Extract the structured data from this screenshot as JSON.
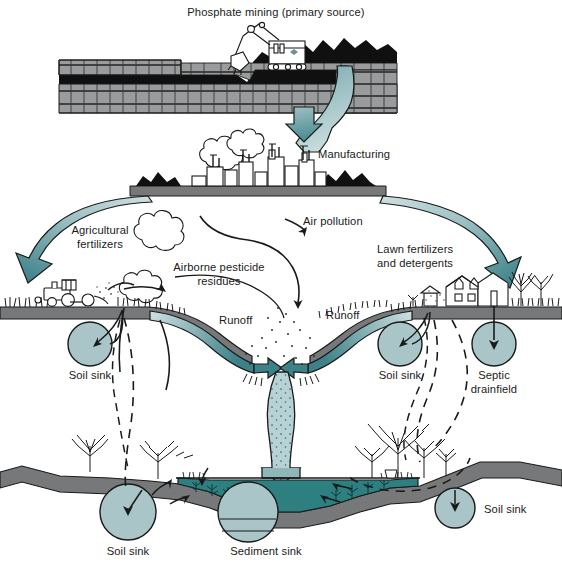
{
  "figure": {
    "title": "Phosphate mining (primary source)",
    "type": "phosphorus-cycle-pollution-pathways-diagram"
  },
  "labels": {
    "phosphate_mining": "Phosphate mining (primary source)",
    "manufacturing": "Manufacturing",
    "air_pollution": "Air pollution",
    "agricultural_fertilizers_line1": "Agricultural",
    "agricultural_fertilizers_line2": "fertilizers",
    "lawn_fertilizers_line1": "Lawn fertilizers",
    "lawn_fertilizers_line2": "and detergents",
    "airborne_pesticide_line1": "Airborne pesticide",
    "airborne_pesticide_line2": "residues",
    "runoff_left": "Runoff",
    "runoff_right": "Runoff",
    "soil_sink_upper_left": "Soil sink",
    "soil_sink_upper_right": "Soil sink",
    "septic_drainfield_line1": "Septic",
    "septic_drainfield_line2": "drainfield",
    "soil_sink_lower_left": "Soil sink",
    "soil_sink_lower_right": "Soil sink",
    "sediment_sink": "Sediment sink"
  },
  "colors": {
    "arrow_light": "#b9d2d4",
    "arrow_dark": "#3d8289",
    "arrow_mid": "#7fb0b4",
    "sink_circle": "#a9c5c8",
    "soil_grey": "#77787a",
    "rock_grey": "#9a9b9d",
    "rock_black": "#101010",
    "lake_water": "#2d7f80",
    "plume_fill": "#a9c9cb",
    "outline": "#111111",
    "text": "#1a1a1a",
    "background": "#ffffff"
  },
  "scene_elements": {
    "mine": {
      "name": "open-pit-mine-with-excavator",
      "excavator": "power-shovel"
    },
    "factory": {
      "name": "manufacturing-plant",
      "detail": "smokestacks-and-smoke-plumes"
    },
    "farm": {
      "name": "farm-field-with-tractor",
      "detail": "tractor-spraying"
    },
    "suburb": {
      "name": "suburban-house-with-trees"
    },
    "lake": {
      "name": "lake-cross-section",
      "detail": "aquatic-vegetation-and-sediment"
    }
  }
}
